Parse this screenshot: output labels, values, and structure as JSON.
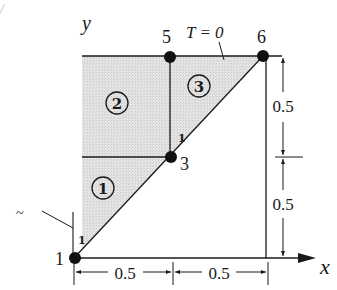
{
  "diagram": {
    "type": "finite-element-mesh",
    "axes": {
      "x_label": "x",
      "y_label": "y"
    },
    "boundary_condition": "T = 0",
    "nodes": [
      {
        "id": "1",
        "label": "1"
      },
      {
        "id": "3",
        "label": "3"
      },
      {
        "id": "5",
        "label": "5"
      },
      {
        "id": "6",
        "label": "6"
      }
    ],
    "elements": [
      {
        "id": "1",
        "label": "1"
      },
      {
        "id": "2",
        "label": "2"
      },
      {
        "id": "3",
        "label": "3"
      }
    ],
    "local_node_labels": [
      "1",
      "1"
    ],
    "dimensions": {
      "horizontal": [
        "0.5",
        "0.5"
      ],
      "vertical": [
        "0.5",
        "0.5"
      ]
    },
    "stray_mark": "~",
    "colors": {
      "shade": "#e0e0e0",
      "line": "#1a1a1a",
      "node": "#111111"
    }
  }
}
